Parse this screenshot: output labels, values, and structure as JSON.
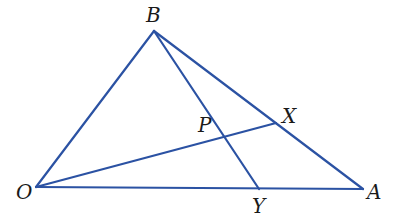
{
  "diagram": {
    "type": "geometry-triangle",
    "line_color": "#2b52a3",
    "label_color": "#1a1a1a",
    "points": {
      "B": {
        "label": "B",
        "x": 154,
        "y": 31,
        "label_x": 146,
        "label_y": 22
      },
      "O": {
        "label": "O",
        "x": 36,
        "y": 187,
        "label_x": 16,
        "label_y": 199
      },
      "A": {
        "label": "A",
        "x": 363,
        "y": 189,
        "label_x": 367,
        "label_y": 199
      },
      "X": {
        "label": "X",
        "x": 276,
        "y": 123,
        "label_x": 282,
        "label_y": 123
      },
      "Y": {
        "label": "Y",
        "x": 259,
        "y": 189,
        "label_x": 252,
        "label_y": 213
      },
      "P": {
        "label": "P",
        "x": 226,
        "y": 134,
        "label_x": 198,
        "label_y": 132
      }
    },
    "segments": [
      {
        "from": "O",
        "to": "B"
      },
      {
        "from": "B",
        "to": "A"
      },
      {
        "from": "O",
        "to": "A"
      },
      {
        "from": "B",
        "to": "Y"
      },
      {
        "from": "O",
        "to": "X"
      }
    ]
  }
}
